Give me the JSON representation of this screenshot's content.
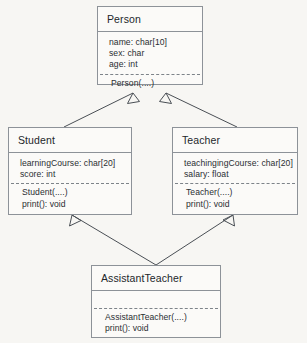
{
  "diagram": {
    "kind": "uml-class-diagram",
    "colors": {
      "background": "#f7f6f3",
      "box_fill": "#fbfaf8",
      "box_border": "#8d9298",
      "text": "#23272b",
      "line": "#4a4f55"
    },
    "classes": [
      {
        "id": "person",
        "name": "Person",
        "attributes": [
          "name: char[10]",
          "sex: char",
          "age: int"
        ],
        "operations": [
          "Person(....)"
        ]
      },
      {
        "id": "student",
        "name": "Student",
        "attributes": [
          "learningCourse: char[20]",
          "score: int"
        ],
        "operations": [
          "Student(....)",
          "print(): void"
        ]
      },
      {
        "id": "teacher",
        "name": "Teacher",
        "attributes": [
          "teachingingCourse: char[20]",
          "salary: float"
        ],
        "operations": [
          "Teacher(....)",
          "print(): void"
        ]
      },
      {
        "id": "assistantteacher",
        "name": "AssistantTeacher",
        "attributes": [],
        "operations": [
          "AssistantTeacher(....)",
          "print(): void"
        ]
      }
    ],
    "relationships": [
      {
        "type": "generalization",
        "from": "Student",
        "to": "Person"
      },
      {
        "type": "generalization",
        "from": "Teacher",
        "to": "Person"
      },
      {
        "type": "generalization",
        "from": "AssistantTeacher",
        "to": "Student"
      },
      {
        "type": "generalization",
        "from": "AssistantTeacher",
        "to": "Teacher"
      }
    ]
  }
}
